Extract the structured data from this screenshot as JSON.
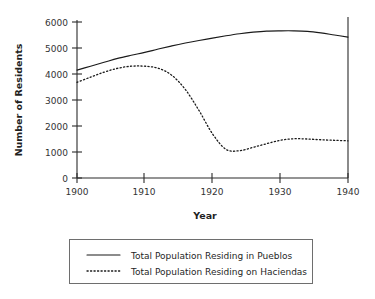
{
  "chart_data": {
    "type": "line",
    "title": "",
    "xlabel": "Year",
    "ylabel": "Number of Residents",
    "xlim": [
      1900,
      1940
    ],
    "ylim": [
      0,
      6000
    ],
    "grid": false,
    "legend_position": "below",
    "x_ticks": [
      "1900",
      "1910",
      "1920",
      "1930",
      "1940"
    ],
    "x_tick_values": [
      1900,
      1910,
      1920,
      1930,
      1940
    ],
    "y_ticks": [
      "0",
      "1000",
      "2000",
      "3000",
      "4000",
      "5000",
      "6000"
    ],
    "y_tick_values": [
      0,
      1000,
      2000,
      3000,
      4000,
      5000,
      6000
    ],
    "x": [
      1900,
      1902,
      1904,
      1906,
      1908,
      1910,
      1912,
      1914,
      1916,
      1918,
      1920,
      1922,
      1924,
      1926,
      1928,
      1930,
      1932,
      1934,
      1936,
      1938,
      1940
    ],
    "series": [
      {
        "name": "Total Population Residing in Pueblos",
        "style": "solid",
        "color": "#1a1a1a",
        "values": [
          4150,
          4300,
          4450,
          4600,
          4720,
          4830,
          4960,
          5080,
          5190,
          5290,
          5380,
          5470,
          5550,
          5610,
          5650,
          5660,
          5660,
          5640,
          5580,
          5500,
          5420
        ]
      },
      {
        "name": "Total Population Residing on Haciendas",
        "style": "dotted",
        "color": "#1a1a1a",
        "values": [
          3680,
          3880,
          4070,
          4220,
          4300,
          4300,
          4220,
          3950,
          3400,
          2600,
          1700,
          1100,
          1050,
          1180,
          1320,
          1450,
          1510,
          1500,
          1470,
          1450,
          1430
        ]
      }
    ]
  },
  "legend": {
    "entries": [
      {
        "label": "Total Population Residing in Pueblos",
        "style": "solid"
      },
      {
        "label": "Total Population Residing on Haciendas",
        "style": "dotted"
      }
    ]
  }
}
